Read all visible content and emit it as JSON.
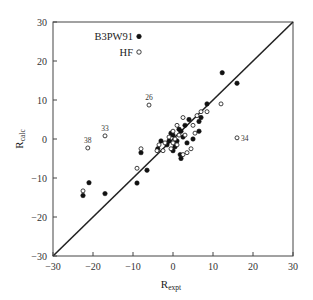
{
  "chart_data": {
    "type": "scatter",
    "title": "",
    "xlabel": "R",
    "xlabel_sub": "expt",
    "ylabel": "R",
    "ylabel_sub": "calc",
    "xlim": [
      -30,
      30
    ],
    "ylim": [
      -30,
      30
    ],
    "xticks": [
      -30,
      -20,
      -10,
      0,
      10,
      20,
      30
    ],
    "yticks": [
      -30,
      -20,
      -10,
      0,
      10,
      20,
      30
    ],
    "grid": false,
    "reference_line": {
      "type": "y=x",
      "from": [
        -30,
        -30
      ],
      "to": [
        30,
        30
      ]
    },
    "legend": {
      "position": "top-left-inside",
      "entries": [
        {
          "label": "B3PW91",
          "marker": "filled-circle"
        },
        {
          "label": "HF",
          "marker": "open-circle"
        }
      ]
    },
    "annotations": [
      {
        "text": "38",
        "x": -21.3,
        "y": -2.3
      },
      {
        "text": "33",
        "x": -17.0,
        "y": 0.8
      },
      {
        "text": "26",
        "x": -6.0,
        "y": 8.7
      },
      {
        "text": "34",
        "x": 16.0,
        "y": 0.3
      }
    ],
    "series": [
      {
        "name": "B3PW91",
        "marker": "filled-circle",
        "points": [
          [
            -22.5,
            -14.5
          ],
          [
            -21.0,
            -11.2
          ],
          [
            -17.0,
            -14.0
          ],
          [
            -9.0,
            -11.3
          ],
          [
            -6.5,
            -8.0
          ],
          [
            -8.0,
            -3.5
          ],
          [
            -3.8,
            -2.5
          ],
          [
            -3.0,
            -0.5
          ],
          [
            -1.5,
            -1.5
          ],
          [
            -0.5,
            1.5
          ],
          [
            0.0,
            1.0
          ],
          [
            0.5,
            -2.0
          ],
          [
            1.0,
            -0.5
          ],
          [
            1.5,
            2.5
          ],
          [
            1.8,
            -4.0
          ],
          [
            2.0,
            -5.0
          ],
          [
            2.5,
            0.5
          ],
          [
            3.0,
            3.5
          ],
          [
            3.5,
            -1.0
          ],
          [
            4.0,
            5.0
          ],
          [
            5.0,
            0.0
          ],
          [
            6.5,
            2.0
          ],
          [
            6.5,
            4.5
          ],
          [
            7.0,
            5.5
          ],
          [
            8.5,
            9.0
          ],
          [
            12.3,
            17.0
          ],
          [
            16.0,
            14.3
          ],
          [
            0.0,
            -3.0
          ],
          [
            -1.0,
            -0.5
          ],
          [
            2.0,
            2.0
          ]
        ]
      },
      {
        "name": "HF",
        "marker": "open-circle",
        "points": [
          [
            -22.5,
            -13.3
          ],
          [
            -21.3,
            -2.3
          ],
          [
            -17.0,
            0.8
          ],
          [
            -9.0,
            -7.5
          ],
          [
            -8.0,
            -2.5
          ],
          [
            -6.0,
            8.7
          ],
          [
            -4.0,
            -3.0
          ],
          [
            -3.5,
            -1.5
          ],
          [
            -2.0,
            -1.0
          ],
          [
            -1.0,
            0.5
          ],
          [
            0.0,
            -1.0
          ],
          [
            0.5,
            0.0
          ],
          [
            1.0,
            3.5
          ],
          [
            1.5,
            1.0
          ],
          [
            2.5,
            5.5
          ],
          [
            2.5,
            -4.0
          ],
          [
            3.5,
            -3.5
          ],
          [
            4.5,
            -2.5
          ],
          [
            5.0,
            3.5
          ],
          [
            6.0,
            6.0
          ],
          [
            7.0,
            7.0
          ],
          [
            8.5,
            7.0
          ],
          [
            12.0,
            9.0
          ],
          [
            16.0,
            0.3
          ],
          [
            -0.5,
            -2.5
          ],
          [
            1.0,
            -1.5
          ],
          [
            3.0,
            1.0
          ],
          [
            5.5,
            1.5
          ],
          [
            -2.5,
            -3.0
          ],
          [
            0.0,
            2.0
          ]
        ]
      }
    ]
  }
}
